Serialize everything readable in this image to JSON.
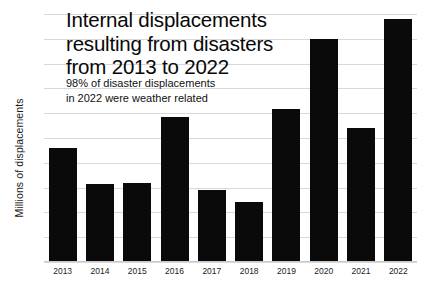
{
  "chart_data": {
    "type": "bar",
    "subtitle": "98% of disaster displacements in 2022 were weather related",
    "xlabel": "",
    "ylabel": "Millions of displacements",
    "categories": [
      "2013",
      "2014",
      "2015",
      "2016",
      "2017",
      "2018",
      "2019",
      "2020",
      "2021",
      "2022"
    ],
    "values": [
      22.2,
      19.3,
      19.4,
      24.7,
      18.8,
      17.8,
      25.3,
      31.0,
      23.8,
      32.6
    ],
    "ylim": [
      13,
      33
    ],
    "ytick_labels": [
      "13",
      "15",
      "17",
      "19",
      "21",
      "23",
      "25",
      "27",
      "29",
      "31",
      "33"
    ],
    "ytick_values": [
      13,
      15,
      17,
      19,
      21,
      23,
      25,
      27,
      29,
      31,
      33
    ],
    "grid": true,
    "legend": false,
    "bar_color": "#0a0a0a",
    "grid_color": "#d8d8d8",
    "background_color": "#ffffff"
  },
  "title_lines": [
    "Internal displacements",
    "resulting from disasters",
    "from 2013 to 2022"
  ],
  "subtitle_lines": [
    "98% of disaster displacements",
    "in 2022 were weather related"
  ]
}
